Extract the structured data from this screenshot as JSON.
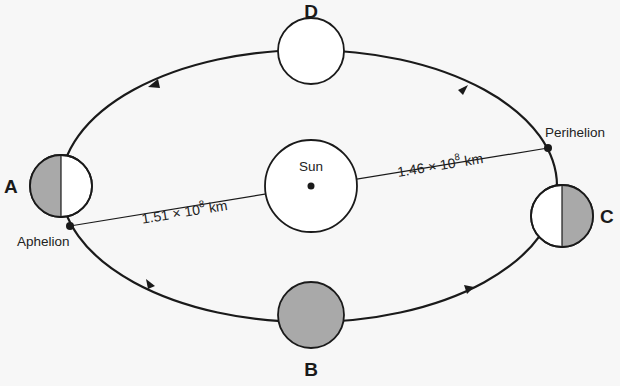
{
  "diagram": {
    "title": "",
    "positions": [
      {
        "id": "A",
        "label": "A",
        "shading": "left-half"
      },
      {
        "id": "B",
        "label": "B",
        "shading": "full"
      },
      {
        "id": "C",
        "label": "C",
        "shading": "right-half"
      },
      {
        "id": "D",
        "label": "D",
        "shading": "none"
      }
    ],
    "sun": {
      "label": "Sun"
    },
    "points": {
      "aphelion": "Aphelion",
      "perihelion": "Perihelion"
    },
    "distances": {
      "aphelion": {
        "base": "1.51 × 10",
        "exp": "8",
        "unit": " km"
      },
      "perihelion": {
        "base": "1.46 × 10",
        "exp": "8",
        "unit": " km"
      }
    },
    "orbit_direction": "counterclockwise",
    "colors": {
      "background": "#f7f7f7",
      "line": "#1a1a1a",
      "shade": "#a9a9a9",
      "planet_fill": "#ffffff"
    }
  }
}
